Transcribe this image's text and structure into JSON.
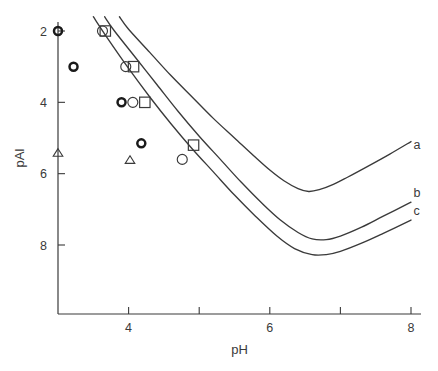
{
  "chart_data": {
    "type": "line",
    "title": "",
    "xlabel": "pH",
    "ylabel": "pAl",
    "xlim": [
      3,
      8
    ],
    "ylim": [
      9.35,
      1.6
    ],
    "y_inverted": true,
    "grid": false,
    "legend_position": "inline-right",
    "x_ticks": [
      4,
      5,
      6,
      7,
      8
    ],
    "x_tick_labels": [
      "4",
      "",
      "6",
      "",
      "8"
    ],
    "y_ticks": [
      2,
      4,
      6,
      8
    ],
    "y_tick_labels": [
      "2",
      "4",
      "6",
      "8"
    ],
    "series": [
      {
        "name": "a",
        "label": "a",
        "label_x": 7.95,
        "label_y": 5.2,
        "points": [
          [
            3.87,
            1.6
          ],
          [
            4.0,
            1.95
          ],
          [
            4.3,
            2.6
          ],
          [
            4.6,
            3.25
          ],
          [
            4.9,
            3.85
          ],
          [
            5.2,
            4.45
          ],
          [
            5.5,
            5.0
          ],
          [
            5.8,
            5.55
          ],
          [
            6.0,
            5.9
          ],
          [
            6.2,
            6.2
          ],
          [
            6.4,
            6.42
          ],
          [
            6.55,
            6.5
          ],
          [
            6.7,
            6.45
          ],
          [
            6.9,
            6.3
          ],
          [
            7.1,
            6.1
          ],
          [
            7.4,
            5.78
          ],
          [
            7.7,
            5.45
          ],
          [
            8.0,
            5.1
          ]
        ]
      },
      {
        "name": "b",
        "label": "b",
        "label_x": 7.95,
        "label_y": 6.55,
        "points": [
          [
            3.66,
            1.6
          ],
          [
            3.8,
            2.0
          ],
          [
            4.1,
            2.75
          ],
          [
            4.4,
            3.5
          ],
          [
            4.7,
            4.25
          ],
          [
            5.0,
            4.95
          ],
          [
            5.3,
            5.6
          ],
          [
            5.6,
            6.25
          ],
          [
            5.9,
            6.85
          ],
          [
            6.15,
            7.3
          ],
          [
            6.4,
            7.65
          ],
          [
            6.6,
            7.83
          ],
          [
            6.8,
            7.85
          ],
          [
            7.0,
            7.75
          ],
          [
            7.3,
            7.5
          ],
          [
            7.6,
            7.2
          ],
          [
            8.0,
            6.8
          ]
        ]
      },
      {
        "name": "c",
        "label": "c",
        "label_x": 7.95,
        "label_y": 7.05,
        "points": [
          [
            3.5,
            1.6
          ],
          [
            3.7,
            2.2
          ],
          [
            4.0,
            3.05
          ],
          [
            4.3,
            3.85
          ],
          [
            4.6,
            4.6
          ],
          [
            4.9,
            5.3
          ],
          [
            5.2,
            5.95
          ],
          [
            5.5,
            6.6
          ],
          [
            5.8,
            7.2
          ],
          [
            6.1,
            7.75
          ],
          [
            6.35,
            8.1
          ],
          [
            6.6,
            8.27
          ],
          [
            6.8,
            8.27
          ],
          [
            7.0,
            8.18
          ],
          [
            7.3,
            7.95
          ],
          [
            7.6,
            7.68
          ],
          [
            8.0,
            7.3
          ]
        ]
      }
    ],
    "scatter_groups": [
      {
        "name": "bold-circle",
        "marker": "bold-circle",
        "points": [
          [
            3.0,
            2.0
          ],
          [
            3.22,
            3.0
          ],
          [
            3.9,
            4.0
          ],
          [
            4.18,
            5.15
          ]
        ]
      },
      {
        "name": "open-circle",
        "marker": "open-circle",
        "points": [
          [
            3.63,
            2.0
          ],
          [
            3.96,
            3.0
          ],
          [
            4.06,
            4.0
          ],
          [
            4.76,
            5.6
          ]
        ]
      },
      {
        "name": "open-square",
        "marker": "open-square",
        "points": [
          [
            3.67,
            2.0
          ],
          [
            4.07,
            3.0
          ],
          [
            4.23,
            4.0
          ],
          [
            4.92,
            5.2
          ]
        ]
      },
      {
        "name": "open-triangle",
        "marker": "open-triangle",
        "points": [
          [
            3.0,
            5.42
          ],
          [
            4.02,
            5.62
          ]
        ]
      }
    ]
  },
  "colors": {
    "axis": "#3a3a3a",
    "curve": "#3a3a3a",
    "marker": "#3a3a3a",
    "marker_bold": "#1a1a1a",
    "background": "#ffffff"
  },
  "axes": {
    "x_title": "pH",
    "y_title": "pAl"
  }
}
